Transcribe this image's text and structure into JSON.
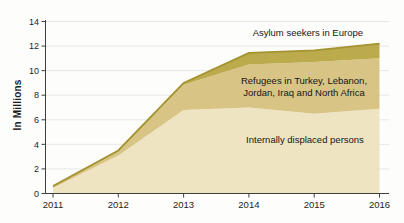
{
  "accent_colors": {
    "asylum_band": "#bcab4d",
    "refugees_band": "#d8c585",
    "idp_band": "#efe4c1",
    "top_edge": "#a49331",
    "grid": "#e7e7e7",
    "axis": "#3f3f3f",
    "text": "#1e1e1e"
  },
  "ylabel": "In Millions",
  "annotations": {
    "asylum": "Asylum seekers in Europe",
    "refugees_line1": "Refugees in Turkey, Lebanon,",
    "refugees_line2": "Jordan, Iraq and North Africa",
    "idp": "Internally displaced persons"
  },
  "chart_data": {
    "type": "area",
    "stacked": true,
    "title": "",
    "xlabel": "",
    "ylabel": "In Millions",
    "ylim": [
      0,
      14
    ],
    "ytick_step": 2,
    "gridlines": true,
    "legend_position": "labels-inside-bands",
    "categories": [
      "2011",
      "2012",
      "2013",
      "2014",
      "2015",
      "2016"
    ],
    "yticks": [
      "0",
      "2",
      "4",
      "6",
      "8",
      "10",
      "12",
      "14"
    ],
    "series": [
      {
        "name": "Internally displaced persons",
        "values": [
          0.45,
          3.1,
          6.8,
          7.0,
          6.5,
          6.9
        ],
        "color": "#efe4c1"
      },
      {
        "name": "Refugees in Turkey, Lebanon, Jordan, Iraq and North Africa",
        "values": [
          0.1,
          0.3,
          2.05,
          3.5,
          4.2,
          4.1
        ],
        "color": "#d8c585"
      },
      {
        "name": "Asylum seekers in Europe",
        "values": [
          0.05,
          0.1,
          0.15,
          0.95,
          0.95,
          1.2
        ],
        "color": "#bcab4d"
      }
    ],
    "cumulative_totals": [
      0.6,
      3.5,
      9.0,
      11.45,
      11.65,
      12.2
    ],
    "top_edge_color": "#a49331",
    "grid_color": "#e7e7e7",
    "axis_color": "#3f3f3f"
  }
}
